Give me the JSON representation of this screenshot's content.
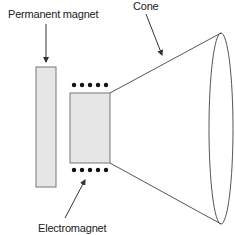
{
  "diagram": {
    "type": "speaker-cross-section",
    "labels": {
      "permanent_magnet": "Permanent magnet",
      "cone": "Cone",
      "electromagnet": "Electromagnet"
    },
    "components": [
      {
        "id": "permanent-magnet",
        "shape": "rectangle",
        "fill": "#e6e6e6",
        "stroke": "#777777"
      },
      {
        "id": "electromagnet",
        "shape": "rectangle",
        "fill": "#e6e6e6",
        "stroke": "#777777",
        "coil_dots_per_row": 5
      },
      {
        "id": "cone",
        "shape": "truncated-cone",
        "stroke": "#555555"
      }
    ],
    "colors": {
      "background": "#ffffff",
      "magnet_fill": "#e6e6e6",
      "outline": "#666666",
      "text": "#222222",
      "dots": "#111111"
    }
  }
}
